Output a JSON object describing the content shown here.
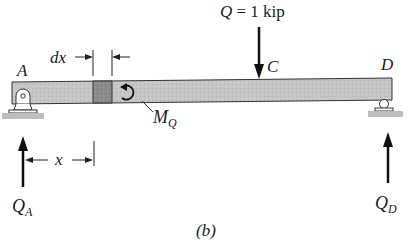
{
  "diagram": {
    "caption": "(b)",
    "beam": {
      "fill": "#c8c8c8",
      "element_fill": "#8e8e8e",
      "outline": "#333333"
    },
    "points": {
      "A": "A",
      "C": "C",
      "D": "D"
    },
    "load": {
      "symbol": "Q",
      "equals": " = 1 kip",
      "label": "Q = 1 kip"
    },
    "moment": {
      "symbol": "M",
      "subscript": "Q"
    },
    "reactions": {
      "left": {
        "symbol": "Q",
        "subscript": "A"
      },
      "right": {
        "symbol": "Q",
        "subscript": "D"
      }
    },
    "dimensions": {
      "element_width": "dx",
      "position": "x"
    },
    "supports": {
      "left": "pin",
      "right": "roller"
    }
  }
}
